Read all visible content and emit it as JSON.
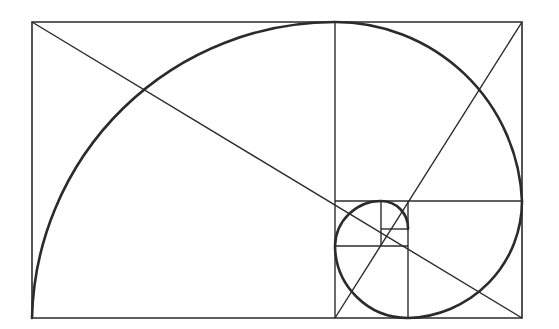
{
  "diagram": {
    "title": "",
    "type": "golden-spiral",
    "stroke_color": "#2b2b2b",
    "background": "#ffffff",
    "outer_rect": {
      "x1": 32,
      "y1": 22,
      "x2": 522,
      "y2": 318
    },
    "divisions": [
      {
        "type": "v",
        "x": 335,
        "y1": 22,
        "y2": 318
      },
      {
        "type": "h",
        "y": 201,
        "x1": 335,
        "x2": 522
      },
      {
        "type": "v",
        "x": 408,
        "y1": 201,
        "y2": 318
      },
      {
        "type": "h",
        "y": 246,
        "x1": 335,
        "x2": 408
      },
      {
        "type": "v",
        "x": 381,
        "y1": 201,
        "y2": 246
      },
      {
        "type": "h",
        "y": 229,
        "x1": 381,
        "x2": 408
      }
    ],
    "diagonals": [
      {
        "x1": 32,
        "y1": 22,
        "x2": 522,
        "y2": 318
      },
      {
        "x1": 522,
        "y1": 22,
        "x2": 335,
        "y2": 318
      }
    ],
    "spiral_arcs": [
      {
        "from": [
          32,
          318
        ],
        "to": [
          335,
          22
        ],
        "r": 303
      },
      {
        "from": [
          335,
          22
        ],
        "to": [
          522,
          201
        ],
        "r": 187
      },
      {
        "from": [
          522,
          201
        ],
        "to": [
          408,
          318
        ],
        "r": 117
      },
      {
        "from": [
          408,
          318
        ],
        "to": [
          335,
          246
        ],
        "r": 73
      },
      {
        "from": [
          335,
          246
        ],
        "to": [
          381,
          201
        ],
        "r": 46
      },
      {
        "from": [
          381,
          201
        ],
        "to": [
          408,
          229
        ],
        "r": 27
      }
    ]
  }
}
